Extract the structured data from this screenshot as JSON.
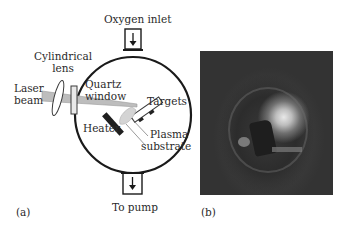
{
  "figure": {
    "panel_a": {
      "label": "(a)",
      "labels": {
        "oxygen_inlet": "Oxygen inlet",
        "cylindrical_lens_1": "Cylindrical",
        "cylindrical_lens_2": "lens",
        "laser_beam_1": "Laser",
        "laser_beam_2": "beam",
        "quartz_window_1": "Quartz",
        "quartz_window_2": "window",
        "targets": "Targets",
        "heater": "Heater",
        "plasma": "Plasma",
        "substrate": "substrate",
        "to_pump": "To pump"
      }
    },
    "panel_b": {
      "label": "(b)"
    }
  }
}
